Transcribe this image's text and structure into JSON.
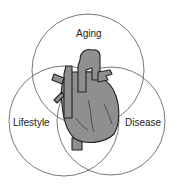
{
  "diagram": {
    "type": "venn",
    "sets": [
      {
        "label": "Aging"
      },
      {
        "label": "Lifestyle"
      },
      {
        "label": "Disease"
      }
    ],
    "center_illustration": "heart-icon",
    "colors": {
      "circle_stroke": "#555555",
      "heart_fill": "#8f8f8f",
      "heart_stroke": "#222222"
    }
  }
}
